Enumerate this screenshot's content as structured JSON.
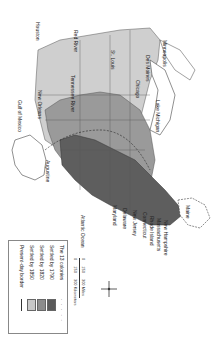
{
  "map": {
    "title": "Settlement of the United States",
    "orientation": "rotated 90 degrees clockwise",
    "colors": {
      "colonies_1790": "#5a5a5a",
      "settled_1820": "#8c8c8c",
      "settled_1850": "#c8c8c8",
      "background": "#ffffff",
      "border": "#333333"
    },
    "labels": {
      "states_east": [
        "New Hampshire",
        "Massachusetts",
        "Rhode Island",
        "Connecticut",
        "New Jersey",
        "Delaware",
        "Maryland"
      ],
      "maine": "Maine",
      "atlantic": "Atlantic Ocean",
      "gulf": "Gulf of Mexico",
      "cities": [
        "Houston",
        "New Orleans",
        "St. Louis",
        "Des Moines",
        "Chicago",
        "Minneapolis",
        "Detroit",
        "Augustine"
      ],
      "rivers": [
        "Red River",
        "Tennessee River"
      ],
      "lakes": [
        "Lake Michigan",
        "Lake Superior",
        "Lake Huron",
        "Lake Erie"
      ],
      "inland": [
        "Cincinnati",
        "Kentucky",
        "Pennsylvania",
        "Virginia",
        "North Carolina",
        "South Carolina",
        "Georgia"
      ]
    },
    "legend": {
      "items": [
        {
          "label": "The 13 colonies",
          "swatch": "dots"
        },
        {
          "label": "Settled by 1790",
          "swatch": "#5a5a5a"
        },
        {
          "label": "Settled by 1820",
          "swatch": "#8c8c8c"
        },
        {
          "label": "Settled by 1850",
          "swatch": "#c8c8c8"
        },
        {
          "label": "Present-day border",
          "swatch": "line"
        }
      ]
    },
    "scale": {
      "miles": [
        "0",
        "150",
        "300 Miles"
      ],
      "km": [
        "0",
        "150",
        "300 Kilometers"
      ]
    }
  }
}
